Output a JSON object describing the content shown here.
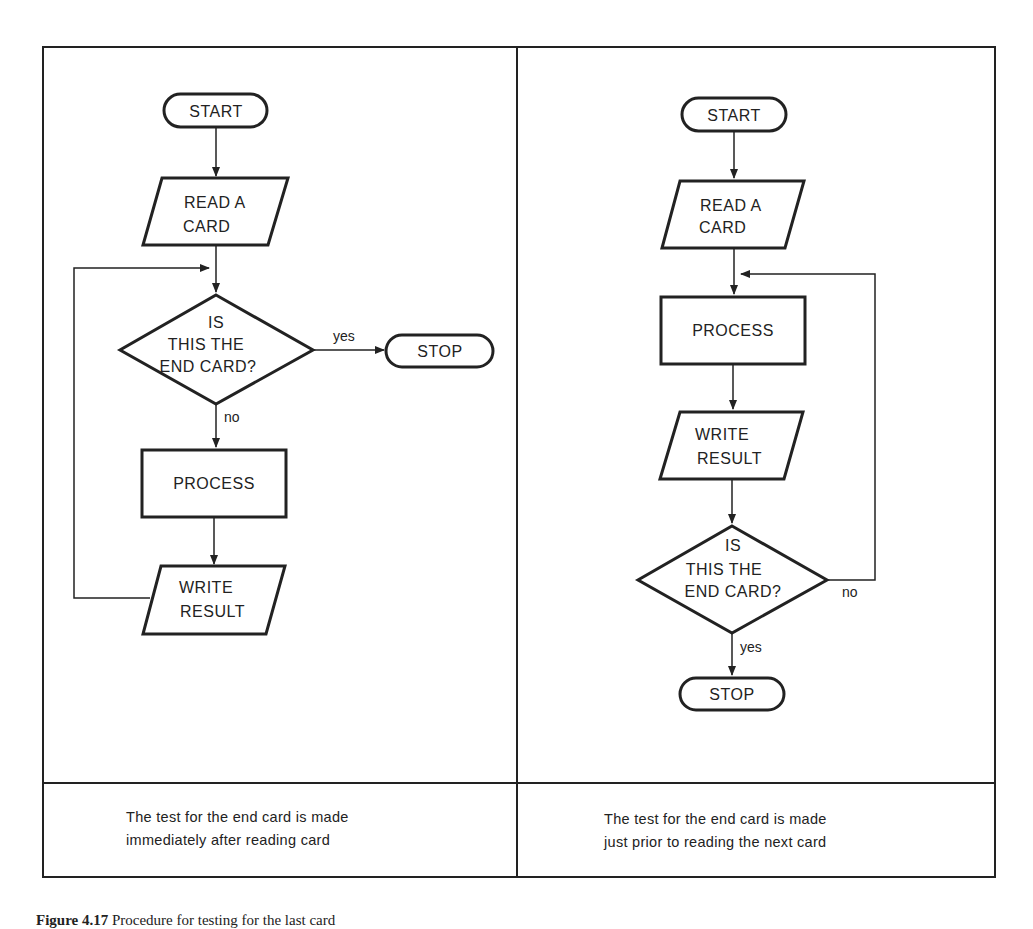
{
  "left_panel": {
    "start": "START",
    "read": [
      "READ A",
      "CARD"
    ],
    "decision": [
      "IS",
      "THIS THE",
      "END CARD?"
    ],
    "yes_label": "yes",
    "no_label": "no",
    "stop": "STOP",
    "process": "PROCESS",
    "write": [
      "WRITE",
      "RESULT"
    ],
    "caption": [
      "The test for the end card is made",
      "immediately after reading card"
    ]
  },
  "right_panel": {
    "start": "START",
    "read": [
      "READ A",
      "CARD"
    ],
    "process": "PROCESS",
    "write": [
      "WRITE",
      "RESULT"
    ],
    "decision": [
      "IS",
      "THIS THE",
      "END CARD?"
    ],
    "no_label": "no",
    "yes_label": "yes",
    "stop": "STOP",
    "caption": [
      "The test for the end card is made",
      "just prior to reading the next card"
    ]
  },
  "figure_caption": {
    "number": "Figure 4.17",
    "text": "Procedure for testing for the last card"
  }
}
